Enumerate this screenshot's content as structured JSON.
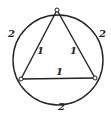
{
  "diagram": {
    "type": "inscribed-triangle-in-circle",
    "circle": {
      "cx": 58,
      "cy": 60,
      "r": 45
    },
    "vertices": [
      {
        "id": "top",
        "x": 57,
        "y": 10
      },
      {
        "id": "bottom-left",
        "x": 21,
        "y": 79
      },
      {
        "id": "bottom-right",
        "x": 95,
        "y": 78
      }
    ],
    "edge_labels": {
      "left": "1",
      "right": "1",
      "bottom": "1"
    },
    "arc_labels": {
      "left": "2",
      "right": "2",
      "bottom": "2"
    },
    "stroke_color": "#222222"
  }
}
